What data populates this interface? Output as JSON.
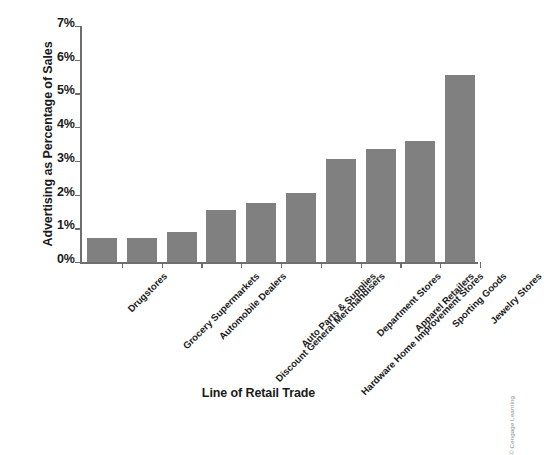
{
  "chart_data": {
    "type": "bar",
    "title": "",
    "xlabel": "Line of Retail Trade",
    "ylabel": "Advertising as Percentage of Sales",
    "categories": [
      "Drugstores",
      "Grocery Supermarkets",
      "Automobile Dealers",
      "Discount General Merchandisers",
      "Auto Parts & Supplies",
      "Hardware Home Improvement Stores",
      "Department Stores",
      "Apparel Retailers",
      "Sporting Goods",
      "Jewelry Stores"
    ],
    "values": [
      0.7,
      0.7,
      0.9,
      1.55,
      1.75,
      2.05,
      3.05,
      3.35,
      3.6,
      5.55
    ],
    "ylim": [
      0,
      7
    ],
    "ytick_labels": [
      "0%",
      "1%",
      "2%",
      "3%",
      "4%",
      "5%",
      "6%",
      "7%"
    ],
    "ytick_values": [
      0,
      1,
      2,
      3,
      4,
      5,
      6,
      7
    ],
    "grid": false,
    "legend": "none",
    "bar_color": "#808080",
    "axis_color": "#6e6e6e",
    "text_color": "#1a1a1a",
    "background": "#ffffff",
    "xtick_label_rotation": -45
  },
  "credit": {
    "text": "© Cengage Learning",
    "color": "#8d8d8d"
  }
}
